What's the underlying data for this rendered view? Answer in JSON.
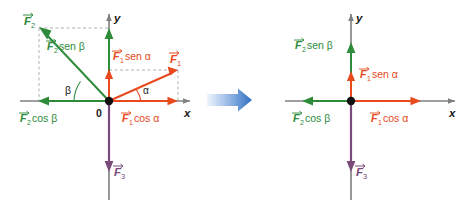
{
  "figure": {
    "title_hidden": "",
    "colors": {
      "green": "#2e8b3a",
      "orange": "#e8491d",
      "purple": "#7a4b7a",
      "axis": "#7f7f7f",
      "dashed": "#b0b0b0",
      "origin_dot": "#111111",
      "arrow_blue_light": "#e8f0fb",
      "arrow_blue_dark": "#2f6fc0",
      "text_dark": "#1a1a1a"
    }
  },
  "left_panel": {
    "name": "vector-decomposition-diagram",
    "axis_x_label": "x",
    "axis_y_label": "y",
    "origin_label": "0",
    "angle_alpha": "α",
    "angle_beta": "β",
    "vectors": [
      {
        "id": "F1",
        "label": "F",
        "sub": "1",
        "color": "#e8491d",
        "direction": "up-right"
      },
      {
        "id": "F2",
        "label": "F",
        "sub": "2",
        "color": "#2e8b3a",
        "direction": "up-left"
      },
      {
        "id": "F3",
        "label": "F",
        "sub": "3",
        "color": "#7a4b7a",
        "direction": "down"
      }
    ],
    "components": [
      {
        "id": "F2-sen-beta",
        "text": "sen β",
        "head": "F",
        "sub": "2",
        "color": "#2e8b3a",
        "axis": "y"
      },
      {
        "id": "F1-sen-alpha",
        "text": "sen α",
        "head": "F",
        "sub": "1",
        "color": "#e8491d",
        "axis": "y"
      },
      {
        "id": "F2-cos-beta",
        "text": "cos β",
        "head": "F",
        "sub": "2",
        "color": "#2e8b3a",
        "axis": "x"
      },
      {
        "id": "F1-cos-alpha",
        "text": "cos α",
        "head": "F",
        "sub": "1",
        "color": "#e8491d",
        "axis": "x"
      }
    ]
  },
  "transition": {
    "name": "transition-arrow",
    "icon": "right-arrow-icon",
    "description": "blue gradient right arrow"
  },
  "right_panel": {
    "name": "resolved-components-diagram",
    "axis_x_label": "x",
    "axis_y_label": "y",
    "components": [
      {
        "id": "F2-sen-beta",
        "text": "sen β",
        "head": "F",
        "sub": "2",
        "color": "#2e8b3a",
        "axis": "y"
      },
      {
        "id": "F1-sen-alpha",
        "text": "sen α",
        "head": "F",
        "sub": "1",
        "color": "#e8491d",
        "axis": "y"
      },
      {
        "id": "F2-cos-beta",
        "text": "cos β",
        "head": "F",
        "sub": "2",
        "color": "#2e8b3a",
        "axis": "x"
      },
      {
        "id": "F1-cos-alpha",
        "text": "cos α",
        "head": "F",
        "sub": "1",
        "color": "#e8491d",
        "axis": "x"
      },
      {
        "id": "F3",
        "text": "",
        "head": "F",
        "sub": "3",
        "color": "#7a4b7a",
        "axis": "y-negative"
      }
    ]
  }
}
